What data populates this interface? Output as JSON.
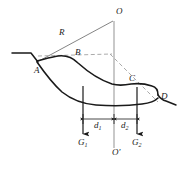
{
  "figure": {
    "colors": {
      "outline": "#1a1a1a",
      "construction": "#8c8c8c",
      "dashed": "#9a9a9a",
      "background": "#ffffff",
      "label": "#1a1a1a"
    },
    "labels": {
      "center_of_curvature": "O",
      "center_projection": "O'",
      "point_a": "A",
      "point_b": "B",
      "point_c": "C",
      "point_d": "D",
      "radius": "R",
      "weight_left": "G",
      "weight_left_sub": "1",
      "weight_right": "G",
      "weight_right_sub": "2",
      "distance_left": "d",
      "distance_left_sub": "1",
      "distance_right": "d",
      "distance_right_sub": "2"
    },
    "geometry": {
      "o_point": [
        114,
        19
      ],
      "o_prime_point": [
        114,
        150
      ],
      "a_point": [
        38,
        62
      ],
      "b_point": [
        75,
        57
      ],
      "c_point": [
        131,
        84
      ],
      "d_point": [
        158,
        100
      ],
      "g1_x": 83,
      "g2_x": 137,
      "dim_line_y": 120,
      "radius_label_pos": [
        60,
        32
      ]
    }
  }
}
